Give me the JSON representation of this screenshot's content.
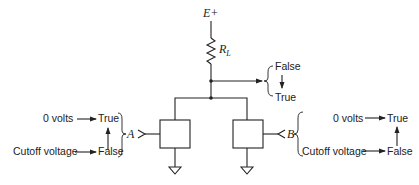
{
  "diagram": {
    "type": "circuit-schematic",
    "supply_label": "E+",
    "resistor_label": "R",
    "resistor_subscript": "L",
    "output": {
      "states": [
        "False",
        "True"
      ],
      "transition": "False → True"
    },
    "input_a": {
      "name": "A",
      "rows": [
        {
          "source": "0 volts",
          "state": "True"
        },
        {
          "source": "Cutoff voltage",
          "state": "False"
        }
      ]
    },
    "input_b": {
      "name": "B",
      "rows": [
        {
          "source": "0 volts",
          "state": "True"
        },
        {
          "source": "Cutoff voltage",
          "state": "False"
        }
      ]
    },
    "colors": {
      "ink": "#222222",
      "background": "#ffffff"
    }
  }
}
